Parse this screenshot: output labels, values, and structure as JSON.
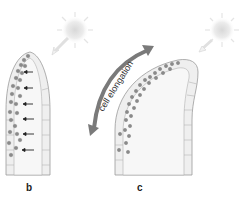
{
  "panels": [
    {
      "id": "b",
      "label": "b"
    },
    {
      "id": "c",
      "label": "c"
    }
  ],
  "annotation": {
    "text": "cell elongation"
  },
  "colors": {
    "sun": "#e6e6e6",
    "shoot_fill": "#eeeeee",
    "outline": "#9a9a9a",
    "particle": "#8a8a8a",
    "arrow": "#7a7a7a",
    "black_arrow": "#222222"
  }
}
